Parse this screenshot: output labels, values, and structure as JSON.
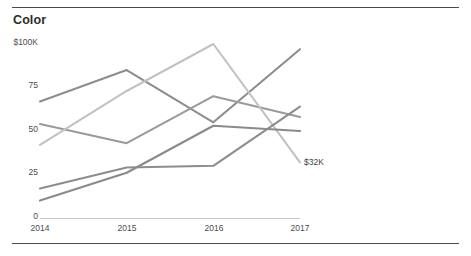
{
  "card": {
    "title": "Color",
    "top_rule_color": "#4a4a4a",
    "bottom_rule_color": "#4a4a4a",
    "background": "#ffffff"
  },
  "chart_data": {
    "type": "line",
    "title": "Color",
    "xlabel": "",
    "ylabel": "",
    "x": [
      "2014",
      "2015",
      "2016",
      "2017"
    ],
    "categories": [
      "2014",
      "2015",
      "2016",
      "2017"
    ],
    "ylim": [
      0,
      100
    ],
    "xlim": [
      "2014",
      "2017"
    ],
    "y_ticks": [
      0,
      25,
      50,
      75,
      100
    ],
    "y_tick_labels": [
      "0",
      "25",
      "50",
      "75",
      "$100K"
    ],
    "x_tick_labels": [
      "2014",
      "2015",
      "2016",
      "2017"
    ],
    "grid": false,
    "legend": "none",
    "units": "$K",
    "annotations": [
      {
        "text": "$32K",
        "x": "2017",
        "y": 32,
        "series": "series-3"
      }
    ],
    "series": [
      {
        "name": "series-1",
        "color": "#8d8d8d",
        "values": [
          67,
          85,
          55,
          97
        ]
      },
      {
        "name": "series-2",
        "color": "#9a9a9a",
        "values": [
          54,
          43,
          70,
          58
        ]
      },
      {
        "name": "series-3",
        "color": "#c2c2c2",
        "values": [
          42,
          73,
          100,
          32
        ]
      },
      {
        "name": "series-4",
        "color": "#8d8d8d",
        "values": [
          17,
          29,
          30,
          64
        ]
      },
      {
        "name": "series-5",
        "color": "#8a8a8a",
        "values": [
          10,
          26,
          53,
          50
        ]
      }
    ],
    "axis_line_color": "#c9c9c9"
  },
  "axes": {
    "y_labels": [
      {
        "text": "$100K",
        "value": 100
      },
      {
        "text": "75",
        "value": 75
      },
      {
        "text": "50",
        "value": 50
      },
      {
        "text": "25",
        "value": 25
      },
      {
        "text": "0",
        "value": 0
      }
    ],
    "x_labels": [
      {
        "text": "2014"
      },
      {
        "text": "2015"
      },
      {
        "text": "2016"
      },
      {
        "text": "2017"
      }
    ]
  }
}
